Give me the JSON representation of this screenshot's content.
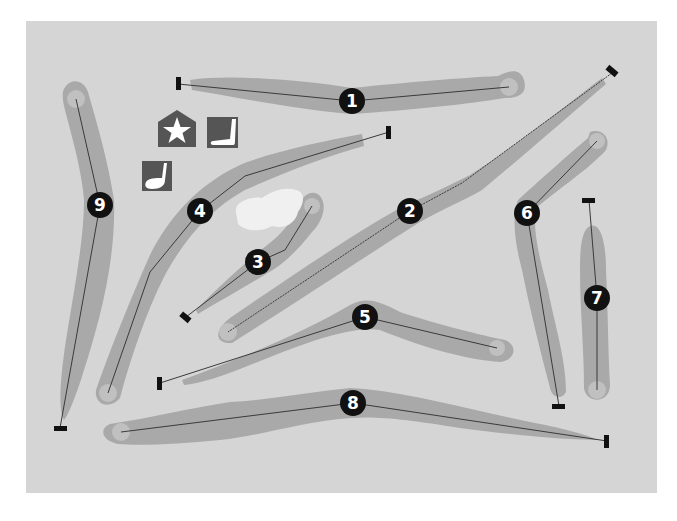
{
  "map": {
    "type": "golf-course-layout",
    "colors": {
      "background": "#d5d5d5",
      "fairway": "#a9a9a9",
      "green": "#c0c0c0",
      "hazard": "#f0f0f0",
      "marker": "#111111",
      "marker_text": "#ffffff",
      "tee": "#111111",
      "line": "#3a3a3a",
      "icon_bg": "#555555",
      "icon_fg": "#ffffff"
    },
    "holes": [
      {
        "number": "1",
        "label": "1",
        "tee": [
          178,
          84
        ],
        "green": [
          509,
          87
        ],
        "marker": [
          352,
          101
        ],
        "path": [
          [
            178,
            84
          ],
          [
            352,
            101
          ],
          [
            509,
            87
          ]
        ]
      },
      {
        "number": "2",
        "label": "2",
        "tee": [
          612,
          73
        ],
        "green": [
          228,
          332
        ],
        "marker": [
          410,
          211
        ],
        "path": [
          [
            612,
            73
          ],
          [
            462,
            183
          ],
          [
            410,
            211
          ],
          [
            228,
            332
          ]
        ]
      },
      {
        "number": "3",
        "label": "3",
        "tee": [
          186,
          317
        ],
        "green": [
          312,
          206
        ],
        "marker": [
          258,
          262
        ],
        "path": [
          [
            186,
            317
          ],
          [
            258,
            262
          ],
          [
            285,
            250
          ],
          [
            312,
            206
          ]
        ]
      },
      {
        "number": "4",
        "label": "4",
        "tee": [
          389,
          132
        ],
        "green": [
          108,
          393
        ],
        "marker": [
          200,
          211
        ],
        "path": [
          [
            389,
            132
          ],
          [
            245,
            176
          ],
          [
            200,
            211
          ],
          [
            150,
            272
          ],
          [
            108,
            393
          ]
        ]
      },
      {
        "number": "5",
        "label": "5",
        "tee": [
          160,
          383
        ],
        "green": [
          497,
          348
        ],
        "marker": [
          365,
          317
        ],
        "path": [
          [
            160,
            383
          ],
          [
            365,
            317
          ],
          [
            497,
            348
          ]
        ]
      },
      {
        "number": "6",
        "label": "6",
        "tee": [
          559,
          406
        ],
        "green": [
          597,
          141
        ],
        "marker": [
          527,
          213
        ],
        "path": [
          [
            559,
            406
          ],
          [
            527,
            213
          ],
          [
            597,
            141
          ]
        ]
      },
      {
        "number": "7",
        "label": "7",
        "tee": [
          589,
          200
        ],
        "green": [
          597,
          390
        ],
        "marker": [
          597,
          298
        ],
        "path": [
          [
            589,
            200
          ],
          [
            597,
            298
          ],
          [
            597,
            390
          ]
        ]
      },
      {
        "number": "8",
        "label": "8",
        "tee": [
          607,
          441
        ],
        "green": [
          121,
          432
        ],
        "marker": [
          353,
          403
        ],
        "path": [
          [
            607,
            441
          ],
          [
            353,
            403
          ],
          [
            121,
            432
          ]
        ]
      },
      {
        "number": "9",
        "label": "9",
        "tee": [
          60,
          428
        ],
        "green": [
          76,
          99
        ],
        "marker": [
          100,
          205
        ],
        "path": [
          [
            60,
            428
          ],
          [
            100,
            205
          ],
          [
            76,
            99
          ]
        ]
      }
    ],
    "facilities": [
      {
        "name": "clubhouse",
        "icon": "clubhouse-star-icon"
      },
      {
        "name": "putting-green",
        "icon": "putter-icon"
      },
      {
        "name": "driving-range",
        "icon": "driver-club-icon"
      }
    ],
    "hazards": [
      {
        "type": "water",
        "name": "water-hazard"
      }
    ]
  }
}
